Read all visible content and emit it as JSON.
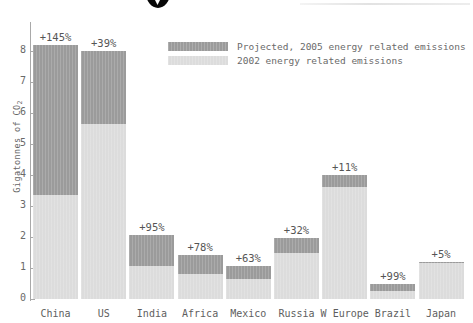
{
  "chart_data": {
    "type": "bar",
    "stacked": true,
    "title": "",
    "subtitle": "",
    "xlabel": "",
    "ylabel": "Gigatonnes of CO2",
    "ylabel_display": "Gigatonnes of CO",
    "ylabel_sub": "2",
    "ylim": [
      0,
      8.6
    ],
    "yticks": [
      0,
      1,
      2,
      3,
      4,
      5,
      6,
      7,
      8
    ],
    "ytick_labels": [
      "0",
      "1",
      "2",
      "3",
      "4",
      "5",
      "6",
      "7",
      "8"
    ],
    "grid": false,
    "legend_position": "top-center",
    "categories": [
      "China",
      "US",
      "India",
      "Africa",
      "Mexico",
      "Russia",
      "W Europe",
      "Brazil",
      "Japan"
    ],
    "series": [
      {
        "name": "2002 energy related emissions",
        "color": "#dcdcdc",
        "values": [
          3.35,
          5.65,
          1.05,
          0.8,
          0.65,
          1.5,
          3.6,
          0.25,
          1.15
        ]
      },
      {
        "name": "Projected, 2005 energy related emissions",
        "color": "#9b9b9b",
        "values": [
          4.85,
          2.35,
          1.0,
          0.62,
          0.41,
          0.48,
          0.4,
          0.25,
          0.06
        ]
      }
    ],
    "totals": [
      8.2,
      8.0,
      2.05,
      1.42,
      1.06,
      1.98,
      4.0,
      0.5,
      1.21
    ],
    "annotations": [
      "+145%",
      "+39%",
      "+95%",
      "+78%",
      "+63%",
      "+32%",
      "+11%",
      "+99%",
      "+5%"
    ],
    "bars": [
      {
        "category": "China",
        "base": 3.35,
        "projected_add": 4.85,
        "total": 8.2,
        "pct_label": "+145%"
      },
      {
        "category": "US",
        "base": 5.65,
        "projected_add": 2.35,
        "total": 8.0,
        "pct_label": "+39%"
      },
      {
        "category": "India",
        "base": 1.05,
        "projected_add": 1.0,
        "total": 2.05,
        "pct_label": "+95%"
      },
      {
        "category": "Africa",
        "base": 0.8,
        "projected_add": 0.62,
        "total": 1.42,
        "pct_label": "+78%"
      },
      {
        "category": "Mexico",
        "base": 0.65,
        "projected_add": 0.41,
        "total": 1.06,
        "pct_label": "+63%"
      },
      {
        "category": "Russia",
        "base": 1.5,
        "projected_add": 0.48,
        "total": 1.98,
        "pct_label": "+32%"
      },
      {
        "category": "W Europe",
        "base": 3.6,
        "projected_add": 0.4,
        "total": 4.0,
        "pct_label": "+11%"
      },
      {
        "category": "Brazil",
        "base": 0.25,
        "projected_add": 0.25,
        "total": 0.5,
        "pct_label": "+99%"
      },
      {
        "category": "Japan",
        "base": 1.15,
        "projected_add": 0.06,
        "total": 1.21,
        "pct_label": "+5%"
      }
    ]
  },
  "legend": {
    "items": [
      {
        "label": "Projected, 2005 energy related emissions",
        "swatch": "proj"
      },
      {
        "label": "2002 energy related emissions",
        "swatch": "base"
      }
    ]
  },
  "colors": {
    "projected": "#9b9b9b",
    "base_2002": "#dcdcdc",
    "axis": "#a9a9a9",
    "text": "#5e5e5e",
    "background": "#ffffff"
  }
}
